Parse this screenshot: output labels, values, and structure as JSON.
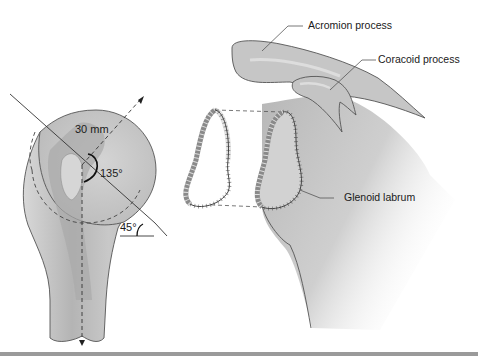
{
  "figure": {
    "labels": {
      "acromion": "Acromion process",
      "coracoid": "Coracoid process",
      "glenoid": "Glenoid labrum"
    },
    "measurements": {
      "head_radius": "30 mm",
      "neck_shaft_angle": "135°",
      "inclination_angle": "45°"
    },
    "colors": {
      "bone_fill": "#c9c9c9",
      "bone_dark": "#a8a8a8",
      "bone_light": "#e2e2e2",
      "outline": "#4a4a4a",
      "rule": "#9a9a9a"
    }
  }
}
